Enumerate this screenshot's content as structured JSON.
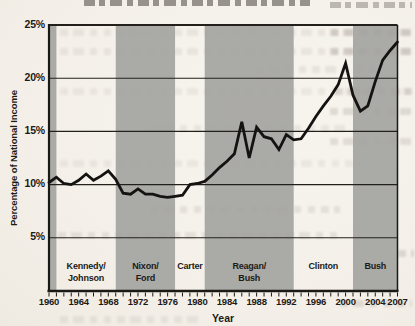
{
  "colors": {
    "paper": "#f5f1ea",
    "band": "#a2a29e",
    "grid": "#23201c",
    "axis": "#1b1915",
    "line": "#151311",
    "text": "#1d1a16"
  },
  "chart_data": {
    "type": "line",
    "ylabel": "Percentage of National Income",
    "xlabel": "Year",
    "x_range": [
      1960,
      2007
    ],
    "y_range": [
      0,
      25
    ],
    "grid": "horizontal gridlines at labeled y ticks",
    "legend": "none",
    "y_ticks": [
      {
        "value": 5,
        "label": "5%"
      },
      {
        "value": 10,
        "label": "10%"
      },
      {
        "value": 15,
        "label": "15%"
      },
      {
        "value": 20,
        "label": "20%"
      },
      {
        "value": 25,
        "label": "25%"
      }
    ],
    "x_ticks_labeled": [
      1960,
      1964,
      1968,
      1972,
      1976,
      1980,
      1984,
      1988,
      1992,
      1996,
      2000,
      2004,
      2007
    ],
    "x_minor_tick_step_years": 1,
    "bands": [
      {
        "start": 1960,
        "end": 1961,
        "shaded": true,
        "label_lines": []
      },
      {
        "start": 1961,
        "end": 1969,
        "shaded": false,
        "label_lines": [
          "Kennedy/",
          "Johnson"
        ]
      },
      {
        "start": 1969,
        "end": 1977,
        "shaded": true,
        "label_lines": [
          "Nixon/",
          "Ford"
        ]
      },
      {
        "start": 1977,
        "end": 1981,
        "shaded": false,
        "label_lines": [
          "Carter"
        ]
      },
      {
        "start": 1981,
        "end": 1993,
        "shaded": true,
        "label_lines": [
          "Reagan/",
          "Bush"
        ]
      },
      {
        "start": 1993,
        "end": 2001,
        "shaded": false,
        "label_lines": [
          "Clinton"
        ]
      },
      {
        "start": 2001,
        "end": 2007,
        "shaded": true,
        "label_lines": [
          "Bush"
        ]
      }
    ],
    "series": [
      {
        "name": "share_of_national_income",
        "color": "#151311",
        "x": [
          1960,
          1961,
          1962,
          1963,
          1964,
          1965,
          1966,
          1967,
          1968,
          1969,
          1970,
          1971,
          1972,
          1973,
          1974,
          1975,
          1976,
          1977,
          1978,
          1979,
          1980,
          1981,
          1982,
          1983,
          1984,
          1985,
          1986,
          1987,
          1988,
          1989,
          1990,
          1991,
          1992,
          1993,
          1994,
          1995,
          1996,
          1997,
          1998,
          1999,
          2000,
          2001,
          2002,
          2003,
          2004,
          2005,
          2006,
          2007
        ],
        "y": [
          10.2,
          10.7,
          10.1,
          10.0,
          10.4,
          11.0,
          10.4,
          10.8,
          11.3,
          10.5,
          9.2,
          9.1,
          9.6,
          9.1,
          9.1,
          8.9,
          8.8,
          8.9,
          9.0,
          10.0,
          10.1,
          10.3,
          10.9,
          11.6,
          12.2,
          12.9,
          15.9,
          12.5,
          15.4,
          14.5,
          14.3,
          13.3,
          14.7,
          14.2,
          14.3,
          15.3,
          16.4,
          17.4,
          18.3,
          19.4,
          21.4,
          18.4,
          16.9,
          17.4,
          19.7,
          21.7,
          22.6,
          23.4
        ]
      }
    ]
  }
}
